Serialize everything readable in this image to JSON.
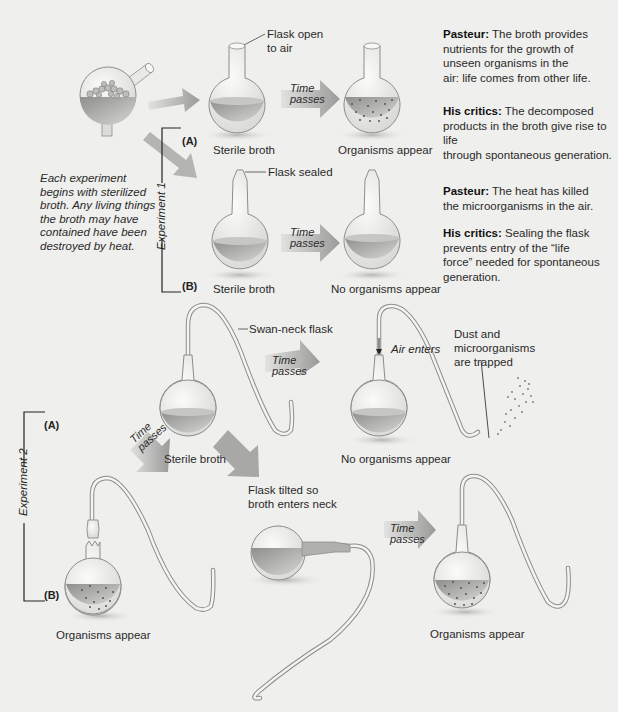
{
  "colors": {
    "background": "#efefed",
    "broth": "#9a9a98",
    "broth_light": "#c8c8c6",
    "glass": "#e6e6e4",
    "glass_outline": "#8d8d8b",
    "arrow": "#9c9c9a",
    "organism_dot": "#555555",
    "text": "#2a2a2a"
  },
  "intro": {
    "text_lines": [
      "Each experiment",
      "begins with sterilized",
      "broth. Any living things",
      "the broth may have",
      "contained have been",
      "destroyed by heat."
    ]
  },
  "experiment1": {
    "label": "Experiment 1",
    "a": {
      "tag": "(A)",
      "flask_callout_lines": [
        "Flask open",
        "to air"
      ],
      "start_caption": "Sterile broth",
      "arrow_text_lines": [
        "Time",
        "passes"
      ],
      "end_caption": "Organisms appear",
      "pasteur_label": "Pasteur:",
      "pasteur_lines": [
        " The broth provides",
        "nutrients for the growth of",
        "unseen organisms in the",
        "air: life comes from other life."
      ],
      "critics_label": "His critics:",
      "critics_lines": [
        " The decomposed",
        "products in the broth give rise to life",
        "through spontaneous generation."
      ]
    },
    "b": {
      "tag": "(B)",
      "flask_callout": "Flask sealed",
      "start_caption": "Sterile broth",
      "arrow_text_lines": [
        "Time",
        "passes"
      ],
      "end_caption": "No organisms appear",
      "pasteur_label": "Pasteur:",
      "pasteur_lines": [
        " The heat has killed",
        "the microorganisms in the air."
      ],
      "critics_label": "His critics:",
      "critics_lines": [
        " Sealing the flask",
        "prevents entry of the “life",
        "force” needed for spontaneous",
        "generation."
      ]
    }
  },
  "experiment2": {
    "label": "Experiment 2",
    "a": {
      "tag": "(A)",
      "flask_callout": "Swan-neck flask",
      "start_caption": "Sterile broth",
      "arrow_text_lines": [
        "Time",
        "passes"
      ],
      "air_label": "Air enters",
      "trap_callout_lines": [
        "Dust and",
        "microorganisms",
        "are trapped"
      ],
      "end_caption": "No organisms appear"
    },
    "b": {
      "tag": "(B)",
      "arrow_left_text_lines": [
        "Time",
        "passes"
      ],
      "broken_caption": "Organisms appear",
      "tilt_callout_lines": [
        "Flask tilted so",
        "broth enters neck"
      ],
      "arrow_text_lines": [
        "Time",
        "passes"
      ],
      "end_caption": "Organisms appear"
    }
  }
}
